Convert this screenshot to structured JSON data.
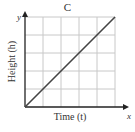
{
  "chart_data": {
    "type": "line",
    "title": "C",
    "xlabel": "Time (t)",
    "ylabel": "Height (h)",
    "x_axis_letter": "x",
    "y_axis_letter": "y",
    "grid": true,
    "grid_cells": {
      "columns": 5,
      "rows": 5
    },
    "xlim": [
      0,
      5
    ],
    "ylim": [
      0,
      5
    ],
    "series": [
      {
        "name": "height",
        "x": [
          0,
          5
        ],
        "y": [
          0,
          5
        ]
      }
    ],
    "line_color": "#444444",
    "grid_color": "#c8c8c8",
    "axis_color": "#222222"
  }
}
